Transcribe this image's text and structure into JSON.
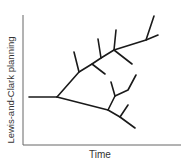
{
  "diagram": {
    "type": "branching-tree",
    "axes": {
      "xlabel": "Time",
      "ylabel": "Lewis-and-Clark planning"
    },
    "colors": {
      "line": "#1a1a1a",
      "axis": "#555555"
    }
  }
}
